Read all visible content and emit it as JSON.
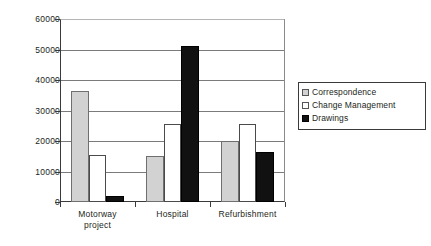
{
  "chart_data": {
    "type": "bar",
    "title": "",
    "subtitle": "",
    "xlabel": "",
    "ylabel": "",
    "categories": [
      "Motorway project",
      "Hospital",
      "Refurbishment"
    ],
    "category_lines": [
      [
        "Motorway",
        "project"
      ],
      [
        "Hospital",
        ""
      ],
      [
        "Refurbishment",
        ""
      ]
    ],
    "series": [
      {
        "name": "Correspondence",
        "color": "#d2d2d2",
        "values": [
          36500,
          15000,
          20000
        ]
      },
      {
        "name": "Change Management",
        "color": "#ffffff",
        "values": [
          15500,
          25500,
          25500
        ]
      },
      {
        "name": "Drawings",
        "color": "#111111",
        "values": [
          2000,
          51000,
          16500
        ]
      }
    ],
    "ylim": [
      0,
      60000
    ],
    "yticks": [
      0,
      10000,
      20000,
      30000,
      40000,
      50000,
      60000
    ],
    "ytick_labels": [
      "0",
      "10000",
      "20000",
      "30000",
      "40000",
      "50000",
      "60000"
    ],
    "grid": true,
    "grid_axis": "y",
    "legend_position": "right"
  },
  "legend": {
    "items": [
      {
        "label": "Correspondence",
        "swatch": "sw-correspondence"
      },
      {
        "label": "Change Management",
        "swatch": "sw-change"
      },
      {
        "label": "Drawings",
        "swatch": "sw-drawings"
      }
    ]
  }
}
